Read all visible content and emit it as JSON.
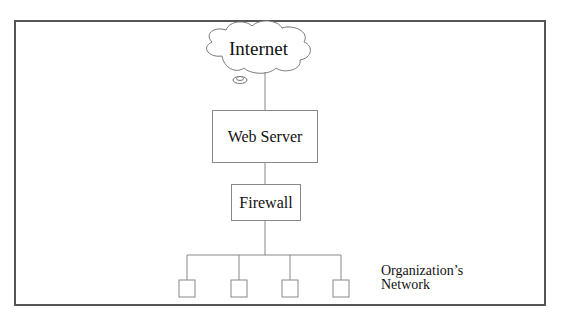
{
  "diagram": {
    "nodes": {
      "internet": {
        "label": "Internet",
        "shape": "cloud"
      },
      "web_server": {
        "label": "Web Server",
        "shape": "rectangle"
      },
      "firewall": {
        "label": "Firewall",
        "shape": "rectangle"
      },
      "network": {
        "label_line1": "Organization’s",
        "label_line2": "Network",
        "hosts": 4
      }
    },
    "edges": [
      {
        "from": "internet",
        "to": "web_server"
      },
      {
        "from": "web_server",
        "to": "firewall"
      },
      {
        "from": "firewall",
        "to": "network"
      }
    ],
    "colors": {
      "border": "#555555",
      "lines": "#888888",
      "text": "#111111"
    }
  }
}
